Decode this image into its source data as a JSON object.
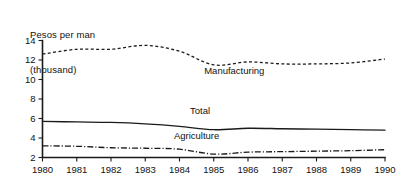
{
  "chart_data": {
    "type": "line",
    "title": "",
    "ylabel": "Pesos per man (thousand)",
    "ylabel_line1": "Pesos per man",
    "ylabel_line2": "(thousand)",
    "xlabel": "",
    "grid": false,
    "legend_position": "inline-annotations",
    "x": [
      1980,
      1981,
      1982,
      1983,
      1984,
      1985,
      1986,
      1987,
      1988,
      1989,
      1990
    ],
    "categories": [
      "1980",
      "1981",
      "1982",
      "1983",
      "1984",
      "1985",
      "1986",
      "1987",
      "1988",
      "1989",
      "1990"
    ],
    "xlim": [
      1980,
      1990
    ],
    "ylim": [
      2,
      14
    ],
    "yticks": [
      2,
      4,
      6,
      8,
      10,
      12,
      14
    ],
    "ytick_labels": [
      "2",
      "4",
      "6",
      "8",
      "10",
      "12",
      "14"
    ],
    "series": [
      {
        "name": "Manufacturing",
        "style": "dashed",
        "label_x": 1985.6,
        "label_y": 10.6,
        "values": [
          12.6,
          13.1,
          13.1,
          13.5,
          12.9,
          11.5,
          11.8,
          11.6,
          11.6,
          11.7,
          12.1
        ]
      },
      {
        "name": "Total",
        "style": "solid",
        "label_x": 1984.6,
        "label_y": 6.5,
        "values": [
          5.7,
          5.65,
          5.6,
          5.45,
          5.2,
          4.85,
          5.0,
          4.95,
          4.9,
          4.85,
          4.8
        ]
      },
      {
        "name": "Agriculture",
        "style": "dash-dot",
        "label_x": 1984.5,
        "label_y": 3.85,
        "values": [
          3.2,
          3.15,
          3.0,
          2.95,
          2.85,
          2.35,
          2.55,
          2.6,
          2.65,
          2.7,
          2.8
        ]
      }
    ]
  },
  "axis": {
    "y_title_line1": "Pesos per man",
    "y_title_line2": "(thousand)"
  },
  "labels": {
    "manufacturing": "Manufacturing",
    "total": "Total",
    "agriculture": "Agriculture"
  },
  "colors": {
    "ink": "#1a1a1a",
    "background": "#ffffff"
  }
}
